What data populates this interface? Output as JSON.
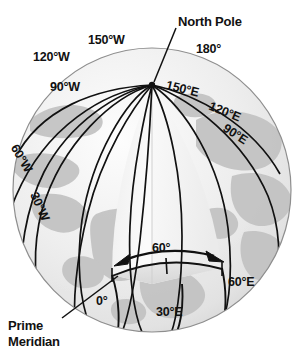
{
  "figure": {
    "type": "globe-diagram",
    "background_color": "#ffffff",
    "ink_color": "#111111",
    "ocean_color": "#ececec",
    "land_color": "#bdbdbd",
    "wedge_light_color": "#f7f7f7",
    "wedge_mid_color": "#e4e4e4",
    "wedge_dark_color": "#d2d2d2"
  },
  "callouts": [
    {
      "id": "north-pole",
      "text": "North Pole",
      "x": 178,
      "y": 14
    },
    {
      "id": "prime-meridian-line1",
      "text": "Prime",
      "x": 8,
      "y": 318
    },
    {
      "id": "prime-meridian-line2",
      "text": "Meridian",
      "x": 8,
      "y": 334
    }
  ],
  "meridian_labels": [
    {
      "id": "lon-120w",
      "text": "120°W",
      "x": 33,
      "y": 50,
      "rotate": 0
    },
    {
      "id": "lon-150w",
      "text": "150°W",
      "x": 88,
      "y": 33,
      "rotate": 0
    },
    {
      "id": "lon-180",
      "text": "180°",
      "x": 196,
      "y": 42,
      "rotate": 0
    },
    {
      "id": "lon-150e",
      "text": "150°E",
      "x": 168,
      "y": 78,
      "rotate": 14
    },
    {
      "id": "lon-120e",
      "text": "120°E",
      "x": 212,
      "y": 99,
      "rotate": 22
    },
    {
      "id": "lon-90e",
      "text": "90°E",
      "x": 228,
      "y": 121,
      "rotate": 33
    },
    {
      "id": "lon-90w",
      "text": "90°W",
      "x": 50,
      "y": 80,
      "rotate": 0
    },
    {
      "id": "lon-60w",
      "text": "60°W",
      "x": 20,
      "y": 142,
      "rotate": -60
    },
    {
      "id": "lon-30w",
      "text": "30°W",
      "x": 40,
      "y": 190,
      "rotate": -66
    },
    {
      "id": "lon-0",
      "text": "0°",
      "x": 96,
      "y": 294,
      "rotate": 0
    },
    {
      "id": "lon-30e",
      "text": "30°E",
      "x": 156,
      "y": 305,
      "rotate": 0
    },
    {
      "id": "lon-60e",
      "text": "60°E",
      "x": 228,
      "y": 275,
      "rotate": 0
    }
  ],
  "angle_annotation": {
    "id": "wedge-angle",
    "text": "60°",
    "x": 152,
    "y": 249,
    "arrow": {
      "from_deg": 0,
      "to_deg": 60,
      "double_headed": true
    }
  }
}
